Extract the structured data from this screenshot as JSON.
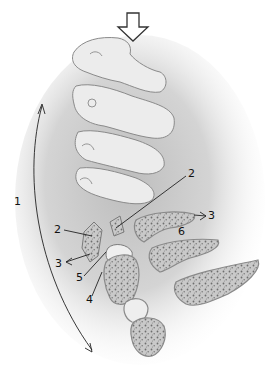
{
  "figure": {
    "colors": {
      "bone": "#e8e8e8",
      "bone_outline": "#7a7a7a",
      "cancellous": "#9a9a9a",
      "shadow": "#b8b8b8",
      "label": "#111111"
    }
  },
  "arrows": {
    "top_block_arrow": "axial-load-arrow",
    "left_curved_arrow": "flexion-arc-arrow"
  },
  "labels": [
    {
      "id": "label-1",
      "text": "1",
      "x": 14,
      "y": 202
    },
    {
      "id": "label-2-upper",
      "text": "2",
      "x": 188,
      "y": 174
    },
    {
      "id": "label-2-left",
      "text": "2",
      "x": 54,
      "y": 224
    },
    {
      "id": "label-3-left",
      "text": "3",
      "x": 55,
      "y": 258
    },
    {
      "id": "label-3-right",
      "text": "3",
      "x": 207,
      "y": 214
    },
    {
      "id": "label-4",
      "text": "4",
      "x": 85,
      "y": 298
    },
    {
      "id": "label-5",
      "text": "5",
      "x": 75,
      "y": 276
    },
    {
      "id": "label-6",
      "text": "6",
      "x": 178,
      "y": 232
    }
  ]
}
